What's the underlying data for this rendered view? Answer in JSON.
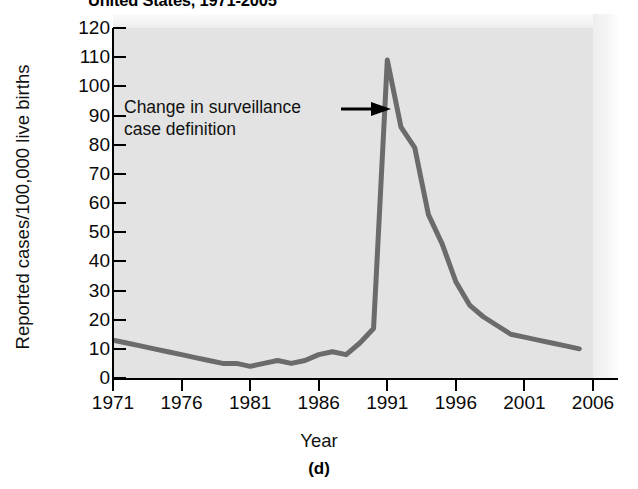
{
  "chart_data": {
    "type": "line",
    "title": "United States, 1971-2005",
    "subtitle": "",
    "xlabel": "Year",
    "ylabel": "Reported cases/100,000 live births",
    "panel_label": "(d)",
    "xlim": [
      1971,
      2006
    ],
    "ylim": [
      0,
      120
    ],
    "x_ticks": [
      "1971",
      "1976",
      "1981",
      "1986",
      "1991",
      "1996",
      "2001",
      "2006"
    ],
    "x_tick_values": [
      1971,
      1976,
      1981,
      1986,
      1991,
      1996,
      2001,
      2006
    ],
    "y_ticks": [
      "120",
      "110",
      "100",
      "90",
      "80",
      "70",
      "60",
      "50",
      "40",
      "30",
      "20",
      "10",
      "0"
    ],
    "y_tick_values": [
      120,
      110,
      100,
      90,
      80,
      70,
      60,
      50,
      40,
      30,
      20,
      10,
      0
    ],
    "grid": false,
    "legend": null,
    "series": [
      {
        "name": "Reported cases per 100,000 live births",
        "color": "#6b6b6b",
        "x": [
          1971,
          1972,
          1973,
          1974,
          1975,
          1976,
          1977,
          1978,
          1979,
          1980,
          1981,
          1982,
          1983,
          1984,
          1985,
          1986,
          1987,
          1988,
          1989,
          1990,
          1991,
          1992,
          1993,
          1994,
          1995,
          1996,
          1997,
          1998,
          1999,
          2000,
          2001,
          2002,
          2003,
          2004,
          2005
        ],
        "values": [
          13,
          12,
          11,
          10,
          9,
          8,
          7,
          6,
          5,
          5,
          4,
          5,
          6,
          5,
          6,
          8,
          9,
          8,
          12,
          17,
          109,
          86,
          79,
          56,
          46,
          33,
          25,
          21,
          18,
          15,
          14,
          13,
          12,
          11,
          10
        ]
      }
    ],
    "annotations": [
      {
        "text_line1": "Change in surveillance",
        "text_line2": "case definition",
        "arrow": "arrow-right",
        "points_to_year": 1990,
        "points_to_value": 92
      }
    ]
  }
}
